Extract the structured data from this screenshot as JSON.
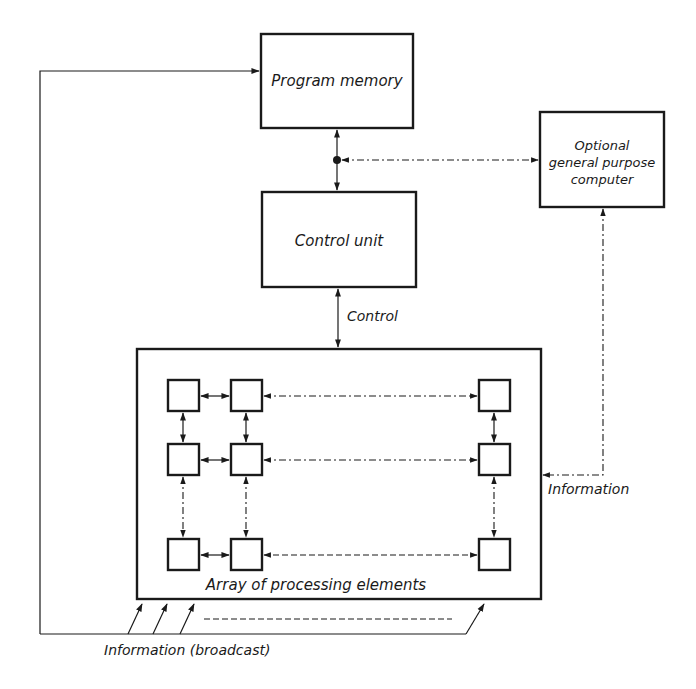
{
  "diagram": {
    "type": "block-diagram",
    "colors": {
      "ink": "#1a1a1a",
      "background": "#ffffff"
    },
    "nodes": {
      "program_memory": {
        "label": "Program memory"
      },
      "control_unit": {
        "label": "Control unit"
      },
      "optional_computer": {
        "label_lines": [
          "Optional",
          "general purpose",
          "computer"
        ]
      },
      "array": {
        "label": "Array of processing elements",
        "grid": {
          "rows": 3,
          "cols": 3,
          "note": "rows/cols continue with dash-dot ellipsis"
        }
      }
    },
    "edges": {
      "control": {
        "label": "Control",
        "from": "control_unit",
        "to": "array",
        "style": "solid-bidirectional"
      },
      "memory_control": {
        "from": "program_memory",
        "to": "control_unit",
        "style": "solid-bidirectional-with-junction"
      },
      "computer_junction": {
        "from": "optional_computer",
        "to": "junction",
        "style": "dash-dot-bidirectional"
      },
      "information": {
        "label": "Information",
        "from": "optional_computer",
        "to": "array",
        "style": "dash-dot"
      },
      "broadcast": {
        "label": "Information (broadcast)",
        "from": "array",
        "to": "program_memory",
        "style": "solid-feedback"
      }
    }
  }
}
